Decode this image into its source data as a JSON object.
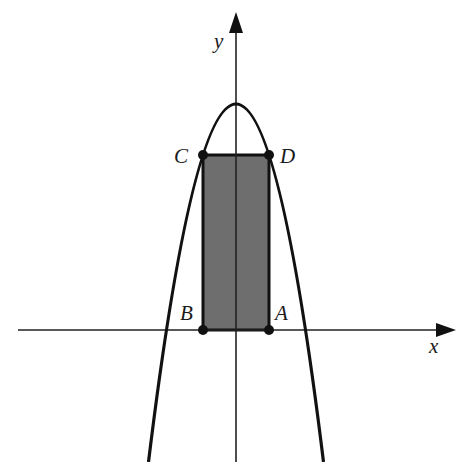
{
  "diagram": {
    "axes": {
      "x_label": "x",
      "y_label": "y"
    },
    "points": {
      "A": "A",
      "B": "B",
      "C": "C",
      "D": "D"
    },
    "colors": {
      "stroke": "#111111",
      "rectangle_fill": "#6e6e6e",
      "background": "#ffffff"
    }
  }
}
